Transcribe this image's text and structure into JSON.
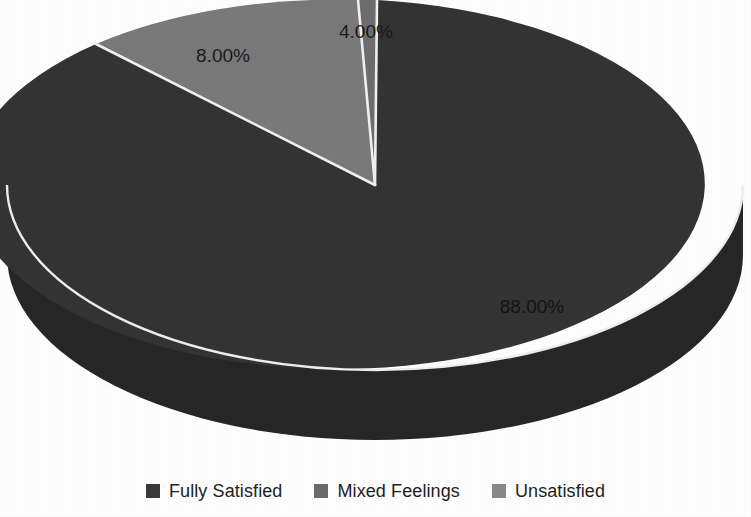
{
  "chart_data": {
    "type": "pie",
    "title": "",
    "subtitle": "",
    "xlabel": "",
    "ylabel": "",
    "grid": false,
    "legend_position": "bottom",
    "three_d": true,
    "categories": [
      "Fully Satisfied",
      "Mixed Feelings",
      "Unsatisfied"
    ],
    "values": [
      88.0,
      8.0,
      4.0
    ],
    "labels": [
      "88.00%",
      "8.00%",
      "4.00%"
    ],
    "colors": [
      "#343434",
      "#7a7a7a",
      "#6e6e6e"
    ],
    "slices": [
      {
        "name": "Fully Satisfied",
        "value": 88.0,
        "label": "88.00%",
        "color": "#343434",
        "side_color": "#272727"
      },
      {
        "name": "Mixed Feelings",
        "value": 8.0,
        "label": "8.00%",
        "color": "#7a7a7a",
        "side_color": "#5c5c5c"
      },
      {
        "name": "Unsatisfied",
        "value": 4.0,
        "label": "4.00%",
        "color": "#6e6e6e",
        "side_color": "#545454"
      }
    ],
    "separator_color": "#f2f2f2",
    "background": "#ffffff"
  },
  "legend": {
    "items": [
      {
        "label": "Fully Satisfied",
        "color": "#3a3a3a",
        "swatch_name": "legend-swatch-fully-satisfied"
      },
      {
        "label": "Mixed Feelings",
        "color": "#6b6b6b",
        "swatch_name": "legend-swatch-mixed-feelings"
      },
      {
        "label": "Unsatisfied",
        "color": "#8a8a8a",
        "swatch_name": "legend-swatch-unsatisfied"
      }
    ]
  },
  "labels_placement": {
    "fully_satisfied": {
      "x": 532,
      "y": 313
    },
    "mixed_feelings": {
      "x": 223,
      "y": 62
    },
    "unsatisfied": {
      "x": 339,
      "y": 38
    }
  }
}
